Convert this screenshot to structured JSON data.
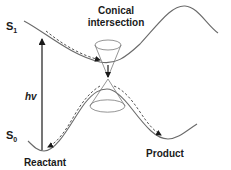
{
  "diagram": {
    "labels": {
      "s1_state": "S",
      "s1_sub": "1",
      "s0_state": "S",
      "s0_sub": "0",
      "excitation": "hv",
      "ci_line1": "Conical",
      "ci_line2": "intersection",
      "reactant": "Reactant",
      "product": "Product"
    },
    "colors": {
      "curve": "#6a6a6a",
      "dashed_path": "#555555",
      "cone": "#7a7a7a",
      "text": "#1a1a1a",
      "background": "#ffffff"
    },
    "elements": [
      {
        "id": "s1-surface",
        "kind": "potential-energy-curve",
        "state": "S1"
      },
      {
        "id": "s0-surface",
        "kind": "potential-energy-curve",
        "state": "S0"
      },
      {
        "id": "excitation-arrow",
        "kind": "vertical-arrow",
        "label": "hv"
      },
      {
        "id": "upper-cone",
        "kind": "cone"
      },
      {
        "id": "lower-cone",
        "kind": "cone"
      },
      {
        "id": "s1-relaxation-path",
        "kind": "dashed-arrow"
      },
      {
        "id": "ci-decay-arrow",
        "kind": "arrow"
      },
      {
        "id": "back-to-reactant-path",
        "kind": "dashed-arrow"
      },
      {
        "id": "to-product-path",
        "kind": "dashed-arrow"
      }
    ]
  }
}
